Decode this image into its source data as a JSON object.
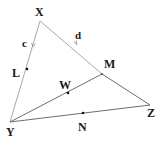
{
  "diagram": {
    "type": "geometry-triangle",
    "points": {
      "X": {
        "label": "X",
        "x": 40,
        "y": 21
      },
      "Y": {
        "label": "Y",
        "x": 10,
        "y": 122
      },
      "Z": {
        "label": "Z",
        "x": 150,
        "y": 105
      },
      "M": {
        "label": "M",
        "x": 102,
        "y": 74
      },
      "L": {
        "label": "L",
        "x": 27,
        "y": 69
      },
      "W": {
        "label": "W",
        "x": 68,
        "y": 93
      },
      "N": {
        "label": "N",
        "x": 83,
        "y": 113
      }
    },
    "segments": [
      {
        "from": "X",
        "to": "Y",
        "vector_label": "c"
      },
      {
        "from": "X",
        "to": "Z",
        "vector_label": "d"
      },
      {
        "from": "Y",
        "to": "Z"
      },
      {
        "from": "Y",
        "to": "M"
      }
    ],
    "vector_labels": {
      "c": "c",
      "d": "d"
    },
    "colors": {
      "line": "#6e6e6e",
      "line_light": "#a8a8a8",
      "text": "#1a1a1a",
      "point": "#111111"
    }
  }
}
